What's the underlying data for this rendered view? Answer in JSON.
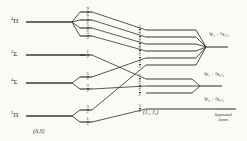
{
  "figure": {
    "background_color": "#fbfaf7",
    "line_color": "#3a3a3a"
  },
  "captions": {
    "left": "(Λ,S)",
    "middle": "(J₁, J₂)",
    "right_separated": "Separated\nAtoms",
    "right_separated_line1": "Separated",
    "right_separated_line2": "Atoms"
  },
  "left_column": {
    "name": "molecular-terms",
    "items": [
      {
        "id": "term-4pi",
        "superscript": "4",
        "symbol": "Π",
        "y": 22,
        "x": 14,
        "line_x1": 26,
        "line_x2": 72
      },
      {
        "id": "term-2sigma",
        "superscript": "2",
        "symbol": "Σ",
        "y": 55,
        "x": 14,
        "line_x1": 26,
        "line_x2": 86
      },
      {
        "id": "term-4sigma",
        "superscript": "4",
        "symbol": "Σ",
        "y": 83,
        "x": 14,
        "line_x1": 26,
        "line_x2": 72
      },
      {
        "id": "term-2pi",
        "superscript": "2",
        "symbol": "Π",
        "y": 116,
        "x": 14,
        "line_x1": 26,
        "line_x2": 72
      }
    ]
  },
  "mid_left_column": {
    "name": "omega-sublevels",
    "note": "J (omega) values produced by splitting of each molecular term",
    "groups": [
      {
        "parent": "term-4pi",
        "fractions": [
          {
            "num": "9",
            "den": "2",
            "y": 12,
            "x": 86,
            "line_x1": 80,
            "line_x2": 92
          },
          {
            "num": "7",
            "den": "2",
            "y": 20,
            "x": 86,
            "line_x1": 80,
            "line_x2": 92
          },
          {
            "num": "5",
            "den": "2",
            "y": 28,
            "x": 86,
            "line_x1": 80,
            "line_x2": 92
          },
          {
            "num": "3",
            "den": "2",
            "y": 36,
            "x": 86,
            "line_x1": 80,
            "line_x2": 92
          }
        ]
      },
      {
        "parent": "term-2sigma",
        "fractions": [
          {
            "num": "1",
            "den": "2",
            "y": 55,
            "x": 86,
            "line_x1": 80,
            "line_x2": 92
          }
        ]
      },
      {
        "parent": "term-4sigma",
        "fractions": [
          {
            "num": "5",
            "den": "2",
            "y": 77,
            "x": 86,
            "line_x1": 80,
            "line_x2": 92
          },
          {
            "num": "3",
            "den": "2",
            "y": 89,
            "x": 86,
            "line_x1": 80,
            "line_x2": 92
          }
        ]
      },
      {
        "parent": "term-2pi",
        "fractions": [
          {
            "num": "3",
            "den": "2",
            "y": 110,
            "x": 86,
            "line_x1": 80,
            "line_x2": 92
          },
          {
            "num": "1",
            "den": "2",
            "y": 122,
            "x": 86,
            "line_x1": 80,
            "line_x2": 92
          }
        ]
      }
    ]
  },
  "mid_right_column": {
    "name": "j1j2-levels",
    "groups": [
      {
        "id": "group-upper",
        "fractions": [
          {
            "num": "5",
            "den": "2",
            "y": 30
          },
          {
            "num": "7",
            "den": "2",
            "y": 37
          },
          {
            "num": "3",
            "den": "2",
            "y": 44
          },
          {
            "num": "9",
            "den": "2",
            "y": 51
          },
          {
            "num": "1",
            "den": "2",
            "y": 58
          },
          {
            "num": "3",
            "den": "2",
            "y": 65
          }
        ],
        "line_x1": 146,
        "line_x2": 196,
        "converge_x": 206,
        "converge_y": 47
      },
      {
        "id": "group-middle",
        "fractions": [
          {
            "num": "3",
            "den": "2",
            "y": 79
          },
          {
            "num": "5",
            "den": "2",
            "y": 86
          },
          {
            "num": "1",
            "den": "2",
            "y": 93
          }
        ],
        "line_x1": 146,
        "line_x2": 192,
        "converge_x": 200,
        "converge_y": 86
      },
      {
        "id": "group-lower",
        "fractions": [
          {
            "num": "1",
            "den": "2",
            "y": 109
          }
        ],
        "line_x1": 146,
        "line_x2": 214,
        "converge_x": 214,
        "converge_y": 109
      }
    ]
  },
  "right_column": {
    "name": "separated-atom-states",
    "items": [
      {
        "id": "atom-state-1",
        "text_parts": {
          "m1": "3",
          "L1": "P",
          "j1": "2",
          "plus": " + ",
          "m2": "2",
          "L2": "S",
          "j2": "1/2"
        },
        "display": "³P₂ + ²S₁⁄₂",
        "x": 210,
        "y": 36
      },
      {
        "id": "atom-state-2",
        "text_parts": {
          "m1": "3",
          "L1": "P",
          "j1": "1",
          "plus": " + ",
          "m2": "2",
          "L2": "S",
          "j2": "1/2"
        },
        "display": "³P₁ + ²S₁⁄₂",
        "x": 205,
        "y": 76
      },
      {
        "id": "atom-state-3",
        "text_parts": {
          "m1": "3",
          "L1": "P",
          "j1": "0",
          "plus": " + ",
          "m2": "2",
          "L2": "S",
          "j2": "1/2"
        },
        "display": "³P₀ + ²S₁⁄₂",
        "x": 205,
        "y": 101
      }
    ]
  },
  "connectors": {
    "name": "correlation-lines",
    "description": "Lines correlating omega sublevels on the left to (J1,J2) levels on the right",
    "paths": [
      {
        "from": "9/2 (4Pi)",
        "to": "group-upper 5/2",
        "x1": 92,
        "y1": 12,
        "x2": 146,
        "y2": 30
      },
      {
        "from": "7/2 (4Pi)",
        "to": "group-upper 7/2",
        "x1": 92,
        "y1": 20,
        "x2": 146,
        "y2": 37
      },
      {
        "from": "5/2 (4Pi)",
        "to": "group-upper 3/2",
        "x1": 92,
        "y1": 28,
        "x2": 146,
        "y2": 44
      },
      {
        "from": "3/2 (4Pi)",
        "to": "group-upper 9/2",
        "x1": 92,
        "y1": 36,
        "x2": 146,
        "y2": 51
      },
      {
        "from": "1/2 (2Sigma)",
        "to": "group-middle 3/2",
        "x1": 92,
        "y1": 55,
        "x2": 146,
        "y2": 79
      },
      {
        "from": "5/2 (4Sigma)",
        "to": "group-upper 1/2",
        "x1": 92,
        "y1": 77,
        "x2": 146,
        "y2": 58
      },
      {
        "from": "3/2 (4Sigma)",
        "to": "group-middle 5/2",
        "x1": 92,
        "y1": 89,
        "x2": 146,
        "y2": 86
      },
      {
        "from": "3/2 (2Pi)",
        "to": "group-upper 3/2b",
        "x1": 92,
        "y1": 110,
        "x2": 146,
        "y2": 65
      },
      {
        "from": "1/2 (2Pi)",
        "to": "group-lower 1/2",
        "x1": 92,
        "y1": 122,
        "x2": 146,
        "y2": 109
      }
    ]
  }
}
